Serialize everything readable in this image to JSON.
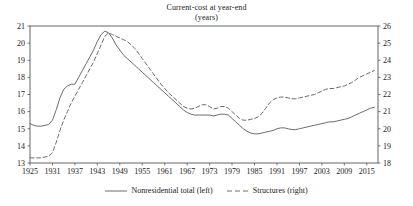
{
  "chart_data": {
    "type": "line",
    "title": "Current-cost at year-end",
    "subtitle": "(years)",
    "xlabel": "",
    "ylabel": "",
    "grid": false,
    "legend_position": "bottom",
    "xlim": [
      1925,
      2018
    ],
    "xticks": [
      1925,
      1931,
      1937,
      1943,
      1949,
      1955,
      1961,
      1967,
      1973,
      1979,
      1985,
      1991,
      1997,
      2003,
      2009,
      2015
    ],
    "left_axis": {
      "label": "",
      "ylim": [
        13,
        21
      ],
      "yticks": [
        13,
        14,
        15,
        16,
        17,
        18,
        19,
        20,
        21
      ]
    },
    "right_axis": {
      "label": "",
      "ylim": [
        18,
        26
      ],
      "yticks": [
        18,
        19,
        20,
        21,
        22,
        23,
        24,
        25,
        26
      ]
    },
    "series": [
      {
        "name": "Nonresidential total (left)",
        "axis": "left",
        "style": "solid",
        "color": "#6b6b6b",
        "x": [
          1925,
          1926,
          1927,
          1928,
          1929,
          1930,
          1931,
          1932,
          1933,
          1934,
          1935,
          1936,
          1937,
          1938,
          1939,
          1940,
          1941,
          1942,
          1943,
          1944,
          1945,
          1946,
          1947,
          1948,
          1949,
          1950,
          1951,
          1952,
          1953,
          1954,
          1955,
          1956,
          1957,
          1958,
          1959,
          1960,
          1961,
          1962,
          1963,
          1964,
          1965,
          1966,
          1967,
          1968,
          1969,
          1970,
          1971,
          1972,
          1973,
          1974,
          1975,
          1976,
          1977,
          1978,
          1979,
          1980,
          1981,
          1982,
          1983,
          1984,
          1985,
          1986,
          1987,
          1988,
          1989,
          1990,
          1991,
          1992,
          1993,
          1994,
          1995,
          1996,
          1997,
          1998,
          1999,
          2000,
          2001,
          2002,
          2003,
          2004,
          2005,
          2006,
          2007,
          2008,
          2009,
          2010,
          2011,
          2012,
          2013,
          2014,
          2015,
          2016,
          2017
        ],
        "values": [
          15.3,
          15.2,
          15.15,
          15.15,
          15.2,
          15.25,
          15.5,
          16.1,
          16.8,
          17.3,
          17.5,
          17.6,
          17.6,
          18.0,
          18.4,
          18.8,
          19.2,
          19.6,
          20.1,
          20.5,
          20.7,
          20.6,
          20.3,
          19.9,
          19.6,
          19.3,
          19.1,
          18.9,
          18.7,
          18.5,
          18.3,
          18.1,
          17.9,
          17.7,
          17.5,
          17.3,
          17.1,
          16.9,
          16.7,
          16.5,
          16.3,
          16.1,
          15.95,
          15.85,
          15.8,
          15.8,
          15.8,
          15.8,
          15.8,
          15.75,
          15.8,
          15.85,
          15.85,
          15.8,
          15.6,
          15.4,
          15.2,
          15.0,
          14.85,
          14.75,
          14.7,
          14.7,
          14.75,
          14.8,
          14.85,
          14.9,
          15.0,
          15.05,
          15.05,
          15.0,
          14.95,
          14.95,
          15.0,
          15.05,
          15.1,
          15.15,
          15.2,
          15.25,
          15.3,
          15.35,
          15.4,
          15.4,
          15.45,
          15.5,
          15.55,
          15.6,
          15.7,
          15.8,
          15.9,
          16.0,
          16.1,
          16.2,
          16.25
        ]
      },
      {
        "name": "Structures (right)",
        "axis": "right",
        "style": "dashed",
        "color": "#6b6b6b",
        "x": [
          1925,
          1926,
          1927,
          1928,
          1929,
          1930,
          1931,
          1932,
          1933,
          1934,
          1935,
          1936,
          1937,
          1938,
          1939,
          1940,
          1941,
          1942,
          1943,
          1944,
          1945,
          1946,
          1947,
          1948,
          1949,
          1950,
          1951,
          1952,
          1953,
          1954,
          1955,
          1956,
          1957,
          1958,
          1959,
          1960,
          1961,
          1962,
          1963,
          1964,
          1965,
          1966,
          1967,
          1968,
          1969,
          1970,
          1971,
          1972,
          1973,
          1974,
          1975,
          1976,
          1977,
          1978,
          1979,
          1980,
          1981,
          1982,
          1983,
          1984,
          1985,
          1986,
          1987,
          1988,
          1989,
          1990,
          1991,
          1992,
          1993,
          1994,
          1995,
          1996,
          1997,
          1998,
          1999,
          2000,
          2001,
          2002,
          2003,
          2004,
          2005,
          2006,
          2007,
          2008,
          2009,
          2010,
          2011,
          2012,
          2013,
          2014,
          2015,
          2016,
          2017
        ],
        "values": [
          18.3,
          18.3,
          18.3,
          18.3,
          18.35,
          18.4,
          18.6,
          19.2,
          19.9,
          20.5,
          21.0,
          21.5,
          21.9,
          22.3,
          22.7,
          23.1,
          23.5,
          23.9,
          24.4,
          24.9,
          25.4,
          25.6,
          25.5,
          25.4,
          25.3,
          25.2,
          25.1,
          24.9,
          24.7,
          24.4,
          24.1,
          23.8,
          23.5,
          23.2,
          22.9,
          22.6,
          22.35,
          22.1,
          21.9,
          21.7,
          21.5,
          21.3,
          21.2,
          21.15,
          21.2,
          21.3,
          21.4,
          21.4,
          21.3,
          21.15,
          21.2,
          21.3,
          21.3,
          21.2,
          21.0,
          20.8,
          20.6,
          20.5,
          20.5,
          20.55,
          20.6,
          20.7,
          20.9,
          21.2,
          21.5,
          21.7,
          21.8,
          21.85,
          21.85,
          21.8,
          21.75,
          21.75,
          21.8,
          21.85,
          21.9,
          21.95,
          22.0,
          22.1,
          22.2,
          22.3,
          22.35,
          22.35,
          22.4,
          22.45,
          22.5,
          22.6,
          22.7,
          22.85,
          23.0,
          23.1,
          23.2,
          23.3,
          23.4
        ]
      }
    ]
  },
  "legend": {
    "items": [
      {
        "label": "Nonresidential total (left)",
        "style": "solid"
      },
      {
        "label": "Structures (right)",
        "style": "dashed"
      }
    ]
  },
  "colors": {
    "line": "#6b6b6b",
    "axis": "#555555",
    "text": "#1a1a1a",
    "background": "#ffffff"
  }
}
